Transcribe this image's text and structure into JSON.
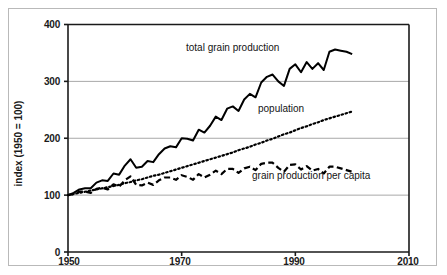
{
  "figure": {
    "background_color": "#ffffff",
    "frame_color": "#b9b9b9",
    "plot_line_color": "#000000",
    "gridline_color": "#a8a8a8"
  },
  "axes": {
    "y_title": "index (1950 = 100)",
    "y_ticks": [
      "0",
      "100",
      "200",
      "300",
      "400"
    ],
    "x_ticks": [
      "1950",
      "1970",
      "1990",
      "2010"
    ]
  },
  "series_labels": {
    "total": "total grain production",
    "population": "population",
    "per_capita": "grain production per capita"
  },
  "chart_data": {
    "type": "line",
    "title": "",
    "xlabel": "",
    "ylabel": "index (1950 = 100)",
    "xlim": [
      1950,
      2010
    ],
    "ylim": [
      0,
      400
    ],
    "xticks": [
      1950,
      1970,
      1990,
      2010
    ],
    "yticks": [
      0,
      100,
      200,
      300,
      400
    ],
    "grid": "horizontal",
    "legend": "inline-annotations",
    "x": [
      1950,
      1951,
      1952,
      1953,
      1954,
      1955,
      1956,
      1957,
      1958,
      1959,
      1960,
      1961,
      1962,
      1963,
      1964,
      1965,
      1966,
      1967,
      1968,
      1969,
      1970,
      1971,
      1972,
      1973,
      1974,
      1975,
      1976,
      1977,
      1978,
      1979,
      1980,
      1981,
      1982,
      1983,
      1984,
      1985,
      1986,
      1987,
      1988,
      1989,
      1990,
      1991,
      1992,
      1993,
      1994,
      1995,
      1996,
      1997,
      1998,
      1999,
      2000
    ],
    "series": [
      {
        "name": "total grain production",
        "style": "solid",
        "label": "total grain production",
        "values": [
          100,
          104,
          110,
          112,
          112,
          122,
          126,
          125,
          138,
          136,
          152,
          163,
          148,
          150,
          160,
          158,
          172,
          182,
          186,
          184,
          200,
          199,
          196,
          215,
          210,
          222,
          238,
          232,
          252,
          256,
          248,
          268,
          278,
          272,
          298,
          308,
          312,
          300,
          292,
          322,
          330,
          316,
          334,
          322,
          332,
          320,
          352,
          356,
          354,
          352,
          348
        ]
      },
      {
        "name": "population",
        "style": "dotted",
        "label": "population",
        "values": [
          100,
          102,
          104,
          106,
          108,
          110,
          112,
          114,
          116,
          118,
          121,
          123,
          126,
          128,
          131,
          134,
          136,
          139,
          142,
          145,
          148,
          151,
          154,
          157,
          160,
          163,
          166,
          169,
          172,
          175,
          179,
          182,
          185,
          189,
          192,
          196,
          199,
          203,
          207,
          210,
          214,
          218,
          221,
          225,
          228,
          232,
          235,
          238,
          241,
          244,
          247
        ]
      },
      {
        "name": "grain production per capita",
        "style": "dashed",
        "label": "grain production per capita",
        "values": [
          100,
          102,
          106,
          106,
          104,
          111,
          113,
          110,
          119,
          115,
          126,
          133,
          118,
          117,
          122,
          118,
          126,
          131,
          131,
          127,
          135,
          132,
          127,
          137,
          131,
          136,
          143,
          137,
          146,
          146,
          139,
          147,
          150,
          144,
          155,
          157,
          157,
          148,
          141,
          153,
          154,
          145,
          151,
          143,
          146,
          138,
          150,
          150,
          147,
          144,
          141
        ]
      }
    ]
  }
}
